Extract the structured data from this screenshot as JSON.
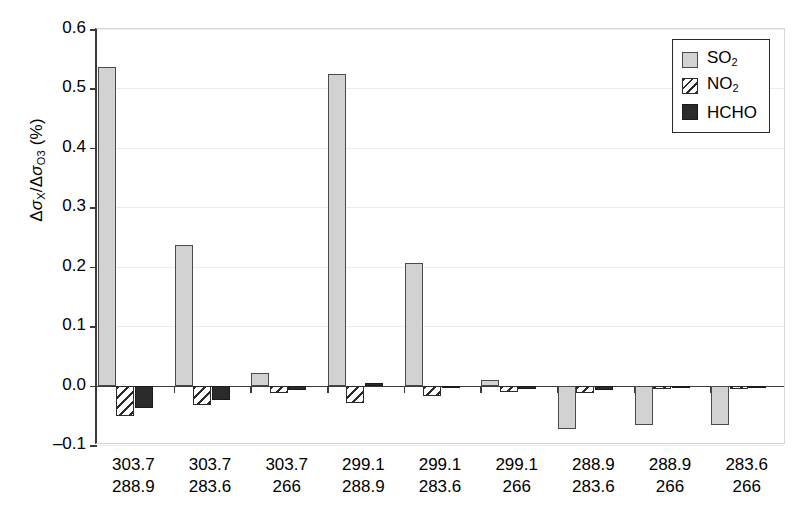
{
  "chart_data": {
    "type": "bar",
    "title": "",
    "xlabel": "",
    "ylabel": "ΔσX/ΔσO3 (%)",
    "ylabel_parts": {
      "delta": "Δ",
      "sigma": "σ",
      "sub_x": "X",
      "sub_o3": "O3",
      "unit": "(%)"
    },
    "ylim": [
      -0.1,
      0.6
    ],
    "yticks": [
      0.6,
      0.5,
      0.4,
      0.3,
      0.2,
      0.1,
      0.0,
      -0.1
    ],
    "ytick_labels": [
      "0.6",
      "0.5",
      "0.4",
      "0.3",
      "0.2",
      "0.1",
      "0.0",
      "-0.1"
    ],
    "grid": true,
    "legend_position": "top-right",
    "categories": [
      "303.7 288.9",
      "303.7 283.6",
      "303.7 266",
      "299.1 288.9",
      "299.1 283.6",
      "299.1 266",
      "288.9 283.6",
      "288.9 266",
      "283.6 266"
    ],
    "category_labels": [
      {
        "line1": "303.7",
        "line2": "288.9"
      },
      {
        "line1": "303.7",
        "line2": "283.6"
      },
      {
        "line1": "303.7",
        "line2": "266"
      },
      {
        "line1": "299.1",
        "line2": "288.9"
      },
      {
        "line1": "299.1",
        "line2": "283.6"
      },
      {
        "line1": "299.1",
        "line2": "266"
      },
      {
        "line1": "288.9",
        "line2": "283.6"
      },
      {
        "line1": "288.9",
        "line2": "266"
      },
      {
        "line1": "283.6",
        "line2": "266"
      }
    ],
    "series": [
      {
        "name": "SO2",
        "label_parts": {
          "text": "SO",
          "sub": "2"
        },
        "fill": "#d2d2d2",
        "pattern": "solid-light-gray",
        "values": [
          0.536,
          0.237,
          0.021,
          0.525,
          0.207,
          0.009,
          -0.073,
          -0.067,
          -0.066
        ]
      },
      {
        "name": "NO2",
        "label_parts": {
          "text": "NO",
          "sub": "2"
        },
        "fill": "#ffffff",
        "pattern": "diagonal-hatch",
        "values": [
          -0.052,
          -0.032,
          -0.012,
          -0.03,
          -0.018,
          -0.01,
          -0.013,
          -0.006,
          -0.005
        ]
      },
      {
        "name": "HCHO",
        "label_parts": {
          "text": "HCHO",
          "sub": ""
        },
        "fill": "#2b2b2b",
        "pattern": "solid-dark",
        "values": [
          -0.037,
          -0.025,
          -0.008,
          0.004,
          -0.002,
          -0.005,
          -0.007,
          -0.004,
          -0.004
        ]
      }
    ]
  },
  "legend": {
    "items": [
      {
        "label": "SO2",
        "text": "SO",
        "sub": "2",
        "swatch": "so2"
      },
      {
        "label": "NO2",
        "text": "NO",
        "sub": "2",
        "swatch": "no2"
      },
      {
        "label": "HCHO",
        "text": "HCHO",
        "sub": "",
        "swatch": "hcho"
      }
    ]
  },
  "colors": {
    "so2": "#d2d2d2",
    "no2": "#ffffff",
    "hcho": "#2b2b2b",
    "axis": "#3a3a3a",
    "grid": "#ececec",
    "background": "#ffffff"
  }
}
